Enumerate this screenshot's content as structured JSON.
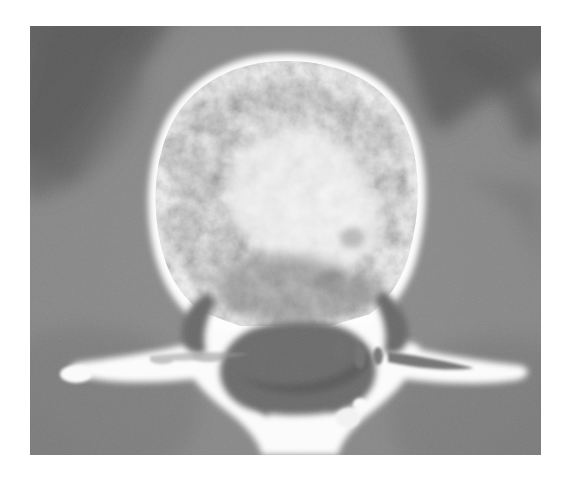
{
  "image": {
    "kind": "medical-ct-scan",
    "modality": "CT",
    "plane": "axial",
    "anatomy": "lumbar vertebra",
    "colorspace": "grayscale",
    "canvas": {
      "width": 568,
      "height": 483,
      "background": "#ffffff"
    },
    "scan_area": {
      "x": 30,
      "y": 26,
      "width": 511,
      "height": 429
    },
    "palette": {
      "page_background": "#ffffff",
      "soft_tissue_background": "#8b8b8b",
      "dark_band": "#5d5d5d",
      "darkest_shadow": "#4a4a4a",
      "cortical_bone_bright": "#fdfdfd",
      "cancellous_bone_mid": "#d7d7d7",
      "trabecular_dark": "#9a9a9a",
      "spinal_canal": "#6a6a6a",
      "lytic_lesion": "#7e7e7e"
    },
    "noise": {
      "present": true,
      "grain": "fine",
      "amplitude": 0.12
    },
    "structures": [
      {
        "name": "vertebral-body",
        "description": "large rounded anterior bone mass with bright cortical rim and mottled trabecular interior"
      },
      {
        "name": "anterior-cortical-rim",
        "description": "bright white margin around the vertebral body"
      },
      {
        "name": "trabecular-bone",
        "description": "mottled coarse gray pattern inside vertebral body"
      },
      {
        "name": "left-pedicle",
        "description": "bone bridge from body to left posterior elements"
      },
      {
        "name": "right-pedicle",
        "description": "bone bridge from body to right posterior elements"
      },
      {
        "name": "spinal-canal",
        "description": "dark triangular low-density region posterior to vertebral body"
      },
      {
        "name": "left-transverse-process",
        "description": "bright elongated wing extending to the left"
      },
      {
        "name": "right-transverse-process",
        "description": "bright elongated wing extending to the right"
      },
      {
        "name": "left-lamina",
        "description": "bone arch posterior-left"
      },
      {
        "name": "right-lamina",
        "description": "bone arch posterior-right"
      },
      {
        "name": "spinous-process",
        "description": "midline posterior bone projection at lower center"
      },
      {
        "name": "paraspinal-soft-tissue",
        "description": "uniform mid-gray muscle and fat surrounding the bone"
      },
      {
        "name": "psoas-shadow-left",
        "description": "darker diagonal band in upper-left background"
      },
      {
        "name": "psoas-shadow-right",
        "description": "darker curved band in upper-right background"
      },
      {
        "name": "lytic-foci",
        "description": "small dark rounded defects within right transverse process and lamina"
      }
    ]
  }
}
